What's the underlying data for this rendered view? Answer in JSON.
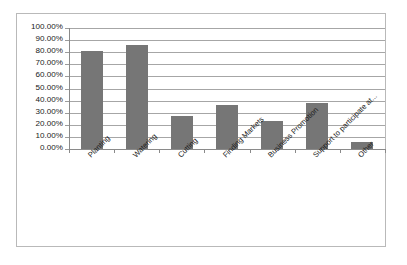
{
  "chart_data": {
    "type": "bar",
    "title": "",
    "subtitle": "",
    "xlabel": "",
    "ylabel": "",
    "ylim": [
      0,
      100
    ],
    "grid": true,
    "legend": false,
    "legend_position": "none",
    "value_suffix": "%",
    "bar_color": "#767676",
    "gridline_color": "#a6a6a6",
    "axis_color": "#8a8a8a",
    "frame_color": "#b9b9b9",
    "background_color": "#ffffff",
    "categories": [
      "Planting",
      "Watering",
      "Cutting",
      "Finding Markets",
      "Business Promotion",
      "Support to participate at...",
      "Other"
    ],
    "values": [
      81,
      86,
      27,
      36,
      23,
      38,
      6
    ],
    "yticks": [
      0,
      10,
      20,
      30,
      40,
      50,
      60,
      70,
      80,
      90,
      100
    ],
    "ytick_labels": [
      "0.00%",
      "10.00%",
      "20.00%",
      "30.00%",
      "40.00%",
      "50.00%",
      "60.00%",
      "70.00%",
      "80.00%",
      "90.00%",
      "100.00%"
    ]
  }
}
